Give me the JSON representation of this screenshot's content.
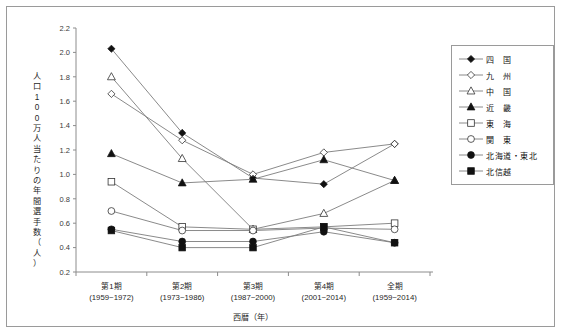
{
  "chart_data": {
    "type": "line",
    "title": "",
    "xlabel": "西暦（年）",
    "ylabel": "人口100万人当たりの年間選手数（人）",
    "ylabel_chars": [
      "人",
      "口",
      "1",
      "0",
      "0",
      "万",
      "人",
      "当",
      "た",
      "り",
      "の",
      "年",
      "間",
      "選",
      "手",
      "数",
      "（",
      "人",
      "）"
    ],
    "categories": [
      "第1期",
      "第2期",
      "第3期",
      "第4期",
      "全期"
    ],
    "category_sublabels": [
      "(1959~1972)",
      "(1973~1986)",
      "(1987~2000)",
      "(2001~2014)",
      "(1959~2014)"
    ],
    "ylim": [
      0.2,
      2.2
    ],
    "yticks": [
      "2.2",
      "2.0",
      "1.8",
      "1.6",
      "1.4",
      "1.2",
      "1.0",
      "0.8",
      "0.6",
      "0.4",
      "0.2"
    ],
    "grid": false,
    "legend_position": "right",
    "series": [
      {
        "name": "四　国",
        "marker": "diamond-filled",
        "values": [
          2.03,
          1.34,
          0.97,
          0.92,
          1.25
        ]
      },
      {
        "name": "九　州",
        "marker": "diamond-open",
        "values": [
          1.66,
          1.28,
          1.0,
          1.18,
          1.25
        ]
      },
      {
        "name": "中　国",
        "marker": "triangle-open",
        "values": [
          1.8,
          1.13,
          0.55,
          0.68,
          0.95
        ]
      },
      {
        "name": "近　畿",
        "marker": "triangle-filled",
        "values": [
          1.17,
          0.93,
          0.96,
          1.12,
          0.95
        ]
      },
      {
        "name": "東　海",
        "marker": "square-open",
        "values": [
          0.94,
          0.57,
          0.55,
          0.57,
          0.6
        ]
      },
      {
        "name": "関　東",
        "marker": "circle-open",
        "values": [
          0.7,
          0.54,
          0.54,
          0.56,
          0.55
        ]
      },
      {
        "name": "北海道・東北",
        "marker": "circle-filled",
        "values": [
          0.55,
          0.45,
          0.45,
          0.53,
          0.44
        ]
      },
      {
        "name": "北信越",
        "marker": "square-filled",
        "values": [
          0.54,
          0.4,
          0.4,
          0.57,
          0.44
        ]
      }
    ]
  },
  "colors": {
    "frame": "#9a9a9a",
    "axis": "#8c8c8c",
    "line": "#7d7d7d",
    "marker_fill": "#111111",
    "marker_open": "#ffffff",
    "background": "#ffffff"
  }
}
